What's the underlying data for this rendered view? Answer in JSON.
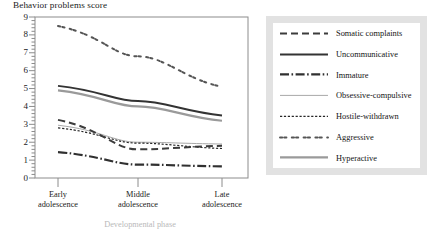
{
  "chart_data": {
    "type": "line",
    "title": "Behavior problems score",
    "xlabel": "Developmental phase",
    "ylabel": "",
    "categories": [
      "Early adolescence",
      "Middle adolescence",
      "Late adolescence"
    ],
    "x_tick_lines": [
      [
        "Early",
        "adolescence"
      ],
      [
        "Middle",
        "adolescence"
      ],
      [
        "Late",
        "adolescence"
      ]
    ],
    "ylim": [
      0,
      9
    ],
    "y_ticks": [
      0,
      1,
      2,
      3,
      4,
      5,
      6,
      7,
      8,
      9
    ],
    "y_minor_ticks_per_interval": 4,
    "grid": false,
    "legend_position": "right",
    "series": [
      {
        "name": "Somatic complaints",
        "style": "dashed",
        "color": "#3c3c3c",
        "width": 2.0,
        "dash": "7,4",
        "values": [
          3.25,
          1.6,
          1.8
        ]
      },
      {
        "name": "Uncommunicative",
        "style": "solid",
        "color": "#333333",
        "width": 2.0,
        "dash": "",
        "values": [
          5.15,
          4.3,
          3.5
        ]
      },
      {
        "name": "Immature",
        "style": "dash-dot",
        "color": "#303030",
        "width": 2.2,
        "dash": "9,2.5,1.6,2.5",
        "values": [
          1.45,
          0.75,
          0.65
        ]
      },
      {
        "name": "Obsessive-compulsive",
        "style": "solid-thin",
        "color": "#a8a8a8",
        "width": 1.0,
        "dash": "",
        "values": [
          2.95,
          2.0,
          1.9
        ]
      },
      {
        "name": "Hostile-withdrawn",
        "style": "dotted",
        "color": "#262626",
        "width": 1.2,
        "dash": "2.2,1.7",
        "values": [
          2.8,
          1.95,
          1.65
        ]
      },
      {
        "name": "Aggressive",
        "style": "dot-pairs",
        "color": "#555555",
        "width": 2.0,
        "dash": "2.2,2.0,2.2,5.4",
        "values": [
          8.5,
          6.8,
          5.1
        ]
      },
      {
        "name": "Hyperactive",
        "style": "solid-gray",
        "color": "#9a9a9a",
        "width": 2.2,
        "dash": "",
        "values": [
          4.9,
          4.0,
          3.2
        ]
      }
    ],
    "legend_entries": [
      "Somatic complaints",
      "Uncommunicative",
      "Immature",
      "Obsessive-compulsive",
      "Hostile-withdrawn",
      "Aggressive",
      "Hyperactive"
    ],
    "colors": {
      "axis": "#8c8c8c",
      "text": "#1b1b1b",
      "legend_background": "#e2e2e2",
      "legend_panel": "#ffffff",
      "plot_background": "#ffffff"
    }
  }
}
